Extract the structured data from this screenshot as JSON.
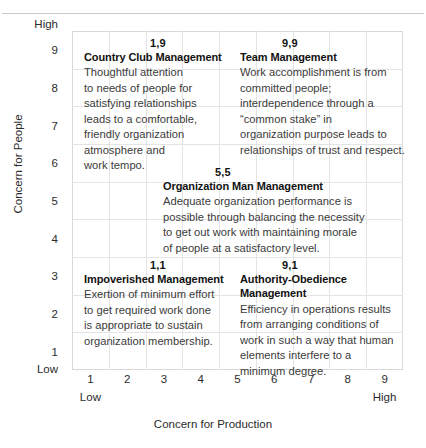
{
  "chart_data": {
    "type": "scatter",
    "title": "",
    "xlabel": "Concern for Production",
    "ylabel": "Concern for People",
    "xlim": [
      1,
      9
    ],
    "ylim": [
      1,
      9
    ],
    "grid": true,
    "legend": "none",
    "x_ticks": [
      "1",
      "2",
      "3",
      "4",
      "5",
      "6",
      "7",
      "8",
      "9"
    ],
    "y_ticks": [
      "9",
      "8",
      "7",
      "6",
      "5",
      "4",
      "3",
      "2",
      "1"
    ],
    "x_axis_low_label": "Low",
    "x_axis_high_label": "High",
    "y_axis_low_label": "Low",
    "y_axis_high_label": "High",
    "points": [
      {
        "code": "1,9",
        "x": 1,
        "y": 9,
        "label": "Country Club Management"
      },
      {
        "code": "9,9",
        "x": 9,
        "y": 9,
        "label": "Team Management"
      },
      {
        "code": "5,5",
        "x": 5,
        "y": 5,
        "label": "Organization Man Management"
      },
      {
        "code": "1,1",
        "x": 1,
        "y": 1,
        "label": "Impoverished Management"
      },
      {
        "code": "9,1",
        "x": 9,
        "y": 1,
        "label": "Authority-Obedience Management"
      }
    ]
  },
  "axes": {
    "y_title": "Concern for People",
    "x_title": "Concern for Production",
    "y_high": "High",
    "y_low": "Low",
    "x_low": "Low",
    "x_high": "High",
    "y_ticks": [
      "9",
      "8",
      "7",
      "6",
      "5",
      "4",
      "3",
      "2",
      "1"
    ],
    "x_ticks": [
      "1",
      "2",
      "3",
      "4",
      "5",
      "6",
      "7",
      "8",
      "9"
    ]
  },
  "styles": {
    "heading_color": "#121212",
    "body_color": "#3b3b3b",
    "grid_line_color": "#e4e4e4",
    "grid_border_color": "#d8d8d8"
  },
  "quadrants": {
    "country_club": {
      "code": "1,9",
      "heading": "Country Club Management",
      "lines": [
        "Thoughtful attention",
        "to needs of people for",
        "satisfying relationships",
        "leads to a comfortable,",
        "friendly organization",
        "atmosphere and",
        "work tempo."
      ]
    },
    "team": {
      "code": "9,9",
      "heading": "Team Management",
      "lines": [
        "Work accomplishment is from",
        "committed people;",
        "interdependence through a",
        "“common stake” in",
        "organization purpose leads to",
        "relationships of trust and respect."
      ]
    },
    "organization_man": {
      "code": "5,5",
      "heading": "Organization Man Management",
      "lines": [
        "Adequate organization performance is",
        "possible through balancing the necessity",
        "to get out work with maintaining morale",
        "of people at a satisfactory level."
      ]
    },
    "impoverished": {
      "code": "1,1",
      "heading": "Impoverished Management",
      "lines": [
        "Exertion of minimum effort",
        "to get required work done",
        "is appropriate to sustain",
        "organization membership."
      ]
    },
    "authority_obedience": {
      "code": "9,1",
      "heading_line1": "Authority-Obedience",
      "heading_line2": "Management",
      "lines": [
        "Efficiency in operations results",
        "from arranging conditions of",
        "work in such a way that human",
        "elements interfere to a",
        "minimum degree."
      ]
    }
  }
}
